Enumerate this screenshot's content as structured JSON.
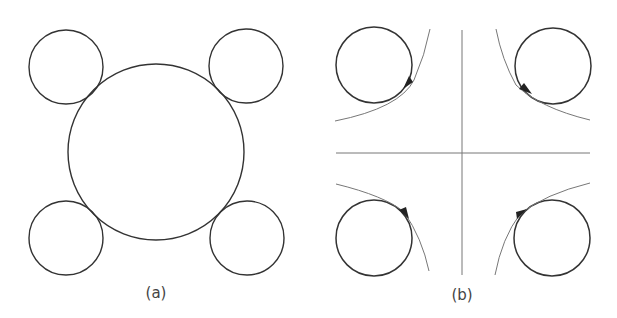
{
  "figure": {
    "panels": [
      {
        "label": "(a)",
        "description": "Large central circle with four smaller circles tangent at the diagonal corners",
        "big_circle": {
          "cx": 156,
          "cy": 152,
          "r": 88
        },
        "small_circles": [
          {
            "cx": 66,
            "cy": 67,
            "r": 37
          },
          {
            "cx": 246,
            "cy": 66,
            "r": 37
          },
          {
            "cx": 66,
            "cy": 238,
            "r": 37
          },
          {
            "cx": 247,
            "cy": 238,
            "r": 37
          }
        ]
      },
      {
        "label": "(b)",
        "description": "Four circles in quadrants, each tangent to a hyperbola branch with direction arrows; crossing axes at center",
        "axes": {
          "cx": 462,
          "cy": 153
        },
        "circles": [
          {
            "cx": 374,
            "cy": 65,
            "r": 38
          },
          {
            "cx": 553,
            "cy": 66,
            "r": 38
          },
          {
            "cx": 374,
            "cy": 238,
            "r": 38
          },
          {
            "cx": 552,
            "cy": 238,
            "r": 38
          }
        ]
      }
    ]
  },
  "colors": {
    "stroke": "#333333",
    "thin": "#777777",
    "background": "#ffffff"
  }
}
